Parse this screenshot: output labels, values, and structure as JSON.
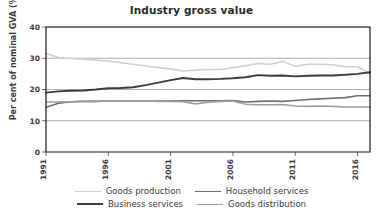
{
  "chart_data": {
    "type": "line",
    "title": "Industry gross value",
    "xlabel": "",
    "ylabel": "Per cent of nominal GVA (%)",
    "ylim": [
      0,
      40
    ],
    "yticks": [
      0,
      10,
      20,
      30,
      40
    ],
    "xlim": [
      1991,
      2017
    ],
    "xticks": [
      1991,
      1996,
      2001,
      2006,
      2011,
      2016
    ],
    "grid": "horizontal",
    "legend_position": "bottom",
    "x": [
      1991,
      1992,
      1993,
      1994,
      1995,
      1996,
      1997,
      1998,
      1999,
      2000,
      2001,
      2002,
      2003,
      2004,
      2005,
      2006,
      2007,
      2008,
      2009,
      2010,
      2011,
      2012,
      2013,
      2014,
      2015,
      2016,
      2017
    ],
    "series": [
      {
        "name": "Goods production",
        "color": "#cfcfcf",
        "width": 1.6,
        "values": [
          31.5,
          30.2,
          29.9,
          29.7,
          29.4,
          29.1,
          28.6,
          28.1,
          27.5,
          27.0,
          26.6,
          25.9,
          26.2,
          26.4,
          26.4,
          27.0,
          27.6,
          28.3,
          28.1,
          29.0,
          27.4,
          28.1,
          28.1,
          27.9,
          27.3,
          27.3,
          25.1
        ]
      },
      {
        "name": "Household services",
        "color": "#6e6e6e",
        "width": 1.6,
        "values": [
          14.3,
          15.6,
          16.1,
          16.2,
          16.2,
          16.3,
          16.3,
          16.3,
          16.3,
          16.3,
          16.3,
          16.4,
          16.4,
          16.4,
          16.4,
          16.5,
          16.0,
          16.2,
          16.3,
          16.2,
          16.5,
          16.8,
          17.0,
          17.2,
          17.4,
          18.0,
          18.0
        ]
      },
      {
        "name": "Business services",
        "color": "#3d3d3d",
        "width": 1.9,
        "values": [
          19.0,
          19.4,
          19.6,
          19.7,
          20.0,
          20.4,
          20.5,
          20.7,
          21.4,
          22.2,
          23.0,
          23.7,
          23.3,
          23.3,
          23.4,
          23.6,
          23.9,
          24.6,
          24.4,
          24.5,
          24.2,
          24.4,
          24.5,
          24.5,
          24.7,
          25.0,
          25.5
        ]
      },
      {
        "name": "Goods distribution",
        "color": "#9e9e9e",
        "width": 1.6,
        "values": [
          16.0,
          16.0,
          16.1,
          16.2,
          16.2,
          16.3,
          16.3,
          16.3,
          16.3,
          16.2,
          16.2,
          16.1,
          15.4,
          15.9,
          16.2,
          16.3,
          15.3,
          15.1,
          15.1,
          15.2,
          14.7,
          14.6,
          14.7,
          14.6,
          14.4,
          14.4,
          14.4
        ]
      }
    ]
  },
  "legend": {
    "items": [
      {
        "label": "Goods production",
        "color": "#cfcfcf",
        "width": 1.6
      },
      {
        "label": "Household services",
        "color": "#6e6e6e",
        "width": 1.8
      },
      {
        "label": "Business services",
        "color": "#3d3d3d",
        "width": 2.1
      },
      {
        "label": "Goods distribution",
        "color": "#9e9e9e",
        "width": 1.6
      }
    ]
  }
}
